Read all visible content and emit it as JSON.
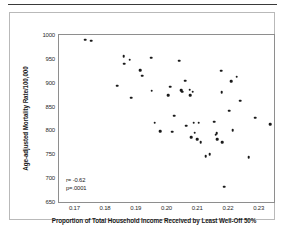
{
  "figure": {
    "background_color": "#ffffff",
    "card_border_color": "#b9b9b9",
    "axis_color": "#8e8e8e",
    "marker_color": "#1a1a1a"
  },
  "annotations": {
    "correlation": "r= -0.62",
    "pvalue": "p=.0001"
  },
  "chart_data": {
    "type": "scatter",
    "title": "",
    "subtitle": "",
    "xlabel": "Proportion of Total Household Income Received by Least Well-Off 50%",
    "ylabel": "Age-adjusted Mortality Rate/100,000",
    "xlim": [
      0.165,
      0.235
    ],
    "ylim": [
      650,
      1000
    ],
    "xticks": [
      0.17,
      0.18,
      0.19,
      0.2,
      0.21,
      0.22,
      0.23
    ],
    "xtick_labels": [
      "0.17",
      "0.18",
      "0.19",
      "0.20",
      "0.21",
      "0.22",
      "0.23"
    ],
    "yticks": [
      650,
      700,
      750,
      800,
      850,
      900,
      950,
      1000
    ],
    "ytick_labels": [
      "650",
      "700",
      "750",
      "800",
      "850",
      "900",
      "950",
      "1000"
    ],
    "grid": false,
    "legend": null,
    "legend_position": "none",
    "annotations": [
      "r= -0.62",
      "p=.0001"
    ],
    "series": [
      {
        "name": "States",
        "marker": "circle",
        "color": "#1a1a1a",
        "points": [
          [
            0.1735,
            990
          ],
          [
            0.1755,
            988
          ],
          [
            0.184,
            894
          ],
          [
            0.186,
            955
          ],
          [
            0.1862,
            940
          ],
          [
            0.188,
            948
          ],
          [
            0.1885,
            869
          ],
          [
            0.1915,
            926
          ],
          [
            0.192,
            915
          ],
          [
            0.195,
            952
          ],
          [
            0.1952,
            883
          ],
          [
            0.1962,
            816
          ],
          [
            0.198,
            798
          ],
          [
            0.2005,
            874
          ],
          [
            0.2012,
            892
          ],
          [
            0.2018,
            797
          ],
          [
            0.2025,
            831
          ],
          [
            0.2042,
            946
          ],
          [
            0.2048,
            884
          ],
          [
            0.2052,
            881
          ],
          [
            0.206,
            904
          ],
          [
            0.2065,
            810
          ],
          [
            0.2075,
            885
          ],
          [
            0.2078,
            874
          ],
          [
            0.208,
            786
          ],
          [
            0.2085,
            881
          ],
          [
            0.2088,
            816
          ],
          [
            0.2092,
            795
          ],
          [
            0.21,
            782
          ],
          [
            0.2105,
            816
          ],
          [
            0.2112,
            775
          ],
          [
            0.2128,
            746
          ],
          [
            0.214,
            750
          ],
          [
            0.2155,
            818
          ],
          [
            0.216,
            791
          ],
          [
            0.2163,
            794
          ],
          [
            0.2165,
            781
          ],
          [
            0.2178,
            925
          ],
          [
            0.218,
            880
          ],
          [
            0.2182,
            775
          ],
          [
            0.2188,
            682
          ],
          [
            0.2205,
            841
          ],
          [
            0.221,
            903
          ],
          [
            0.2215,
            801
          ],
          [
            0.2228,
            913
          ],
          [
            0.224,
            862
          ],
          [
            0.2268,
            744
          ],
          [
            0.2288,
            827
          ],
          [
            0.2338,
            813
          ]
        ]
      }
    ]
  }
}
